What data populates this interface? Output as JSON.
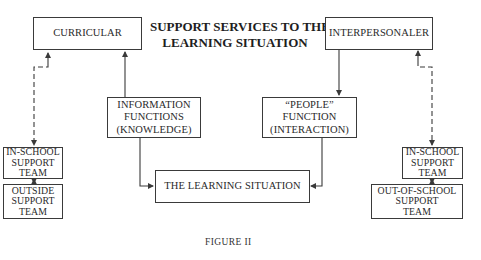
{
  "title": {
    "line1": "SUPPORT SERVICES TO THE",
    "line2": "LEARNING SITUATION"
  },
  "nodes": {
    "curricular": {
      "lines": [
        "CURRICULAR"
      ]
    },
    "interpersonal": {
      "lines": [
        "INTERPERSONALER"
      ]
    },
    "information": {
      "lines": [
        "INFORMATION",
        "FUNCTIONS",
        "(KNOWLEDGE)"
      ]
    },
    "people": {
      "lines": [
        "“PEOPLE”",
        "FUNCTION",
        "(INTERACTION)"
      ]
    },
    "learning": {
      "lines": [
        "THE LEARNING SITUATION"
      ]
    },
    "left_inschool": {
      "lines": [
        "IN-SCHOOL",
        "SUPPORT",
        "TEAM"
      ]
    },
    "outside": {
      "lines": [
        "OUTSIDE",
        "SUPPORT",
        "TEAM"
      ]
    },
    "right_inschool": {
      "lines": [
        "IN-SCHOOL",
        "SUPPORT",
        "TEAM"
      ]
    },
    "out_of_school": {
      "lines": [
        "OUT-OF-SCHOOL",
        "SUPPORT",
        "TEAM"
      ]
    }
  },
  "edges": [
    {
      "from": "information",
      "to": "curricular",
      "style": "solid"
    },
    {
      "from": "information",
      "to": "learning",
      "style": "solid"
    },
    {
      "from": "interpersonal",
      "to": "people",
      "style": "solid"
    },
    {
      "from": "people",
      "to": "learning",
      "style": "solid"
    },
    {
      "from": "curricular",
      "to": "left_inschool",
      "style": "dashed",
      "bidirectional": true
    },
    {
      "from": "interpersonal",
      "to": "right_inschool",
      "style": "dashed",
      "bidirectional": true
    },
    {
      "from": "left_inschool",
      "to": "outside",
      "style": "solid",
      "bidirectional": true
    },
    {
      "from": "right_inschool",
      "to": "out_of_school",
      "style": "solid",
      "bidirectional": true
    }
  ],
  "caption": "FIGURE II",
  "colors": {
    "line": "#3a3a3a",
    "text": "#2a2a2a",
    "background": "#ffffff"
  }
}
